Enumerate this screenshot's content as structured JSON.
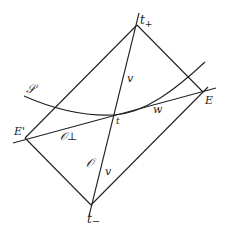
{
  "diagram": {
    "points": {
      "t_plus": {
        "label": "t+",
        "base": "t",
        "sub": "+",
        "x": 137,
        "y": 25
      },
      "t_minus": {
        "label": "t−",
        "base": "t",
        "sub": "−",
        "x": 91,
        "y": 205
      },
      "t": {
        "label": "t",
        "x": 114,
        "y": 115
      },
      "E": {
        "label": "E",
        "x": 203,
        "y": 92
      },
      "E_prime": {
        "label": "E'",
        "x": 25,
        "y": 138
      }
    },
    "labels": {
      "surface": "𝒮",
      "v_upper": "v",
      "v_lower": "v",
      "w": "w",
      "O_perp": "𝒪⊥",
      "O": "𝒪"
    },
    "stroke_color": "#222222"
  }
}
